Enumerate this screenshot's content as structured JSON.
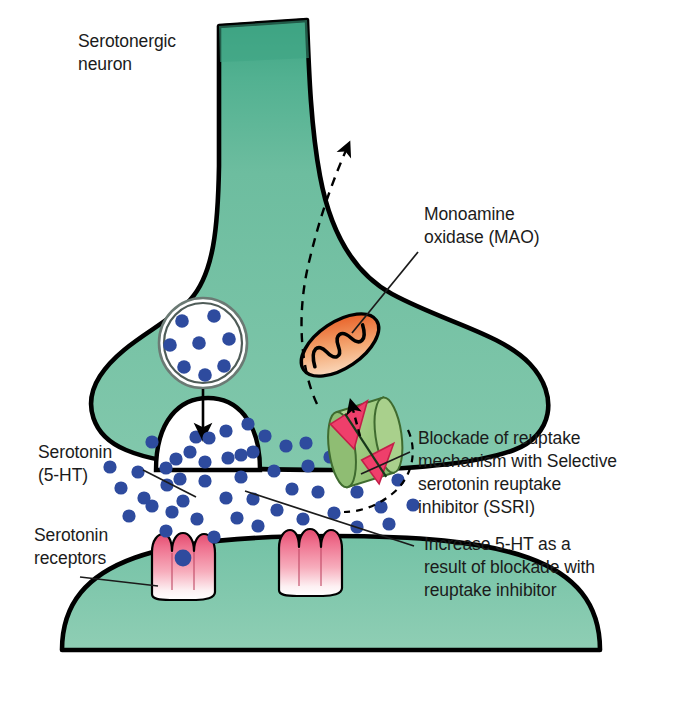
{
  "figure": {
    "width": 678,
    "height": 701
  },
  "labels": {
    "serotonergic_neuron": "Serotonergic\nneuron",
    "mao": "Monoamine\noxidase (MAO)",
    "serotonin": "Serotonin\n(5-HT)",
    "serotonin_receptors": "Serotonin\nreceptors",
    "ssri_blockade": "Blockade of reuptake\nmechanism with Selective\nserotonin reuptake\ninhibitor (SSRI)",
    "increase_5ht": "Increase 5-HT as a\nresult of blockade with\nreuptake inhibitor"
  },
  "colors": {
    "presynaptic_green": "#74bfa2",
    "presynaptic_green_dark": "#3ea483",
    "postsynaptic_green": "#7ec6aa",
    "outline_black": "#000000",
    "serotonin_blue": "#2e4b9e",
    "mitochondrion_orange": "#f3a46b",
    "mitochondrion_orange_dark": "#e8622a",
    "receptor_pink": "#ef6d86",
    "receptor_pink_dark": "#d9405e",
    "transporter_green": "#9cc97f",
    "blockade_pink": "#ef3f6b",
    "vesicle_white": "#ffffff",
    "text_black": "#1b1b1b",
    "background": "#ffffff"
  },
  "structures": {
    "presynaptic_terminal": "serotonergic-axon-terminal",
    "postsynaptic_cell": "postsynaptic-neuron-dome",
    "synaptic_vesicle": {
      "name": "synaptic-vesicle",
      "dot_count": 8
    },
    "release_site": {
      "name": "vesicle-release-site",
      "dot_count": 5
    },
    "mitochondrion": {
      "name": "mitochondrion-mao",
      "cristae": "wavy-line"
    },
    "transporter": {
      "name": "serotonin-reuptake-transporter-blocked"
    },
    "receptors": [
      {
        "name": "serotonin-receptor-left",
        "bound_serotonin": true
      },
      {
        "name": "serotonin-receptor-right",
        "bound_serotonin": false
      }
    ],
    "cleft_serotonin_dot_count": 46
  },
  "arrows": {
    "vesicle_to_release": "solid-down-arrow",
    "mao_metabolite_efflux": "dashed-curved-arrow-up",
    "reuptake_blocked": "dashed-short-arrow-up",
    "cleft_accumulation": "dashed-curve"
  }
}
